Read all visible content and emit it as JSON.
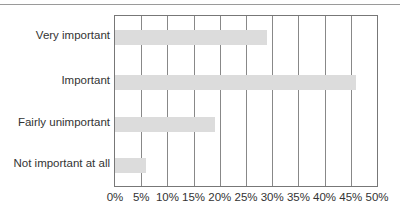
{
  "chart_data": {
    "type": "bar",
    "orientation": "horizontal",
    "title": "",
    "xlabel": "",
    "ylabel": "",
    "categories": [
      "Very important",
      "Important",
      "Fairly unimportant",
      "Not important at all"
    ],
    "values": [
      29,
      46,
      19,
      6
    ],
    "unit": "%",
    "xlim": [
      0,
      50
    ],
    "x_ticks": [
      "0%",
      "5%",
      "10%",
      "15%",
      "20%",
      "25%",
      "30%",
      "35%",
      "40%",
      "45%",
      "50%"
    ],
    "grid": true,
    "legend": null,
    "bar_color": "#dcdcdc",
    "grid_color": "#888888"
  }
}
